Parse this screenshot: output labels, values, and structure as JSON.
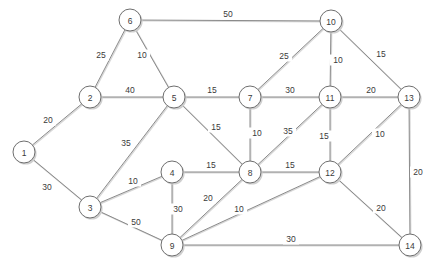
{
  "diagram": {
    "type": "node-link-weighted-graph",
    "colors": {
      "background": "#ffffff",
      "node_fill": "#ffffff",
      "node_stroke": "#6e6e6e",
      "edge_stroke": "#8a8a8a",
      "shadow": "#cfcfcf",
      "text": "#3a3a3a"
    },
    "node_radius": 11
  },
  "chart_data": {
    "type": "graph",
    "directed": false,
    "node_count": 14,
    "edge_count": 28,
    "nodes": [
      {
        "id": "1",
        "label": "1",
        "x": 24,
        "y": 152
      },
      {
        "id": "2",
        "label": "2",
        "x": 90,
        "y": 97
      },
      {
        "id": "3",
        "label": "3",
        "x": 90,
        "y": 207
      },
      {
        "id": "4",
        "label": "4",
        "x": 172,
        "y": 172
      },
      {
        "id": "5",
        "label": "5",
        "x": 174,
        "y": 97
      },
      {
        "id": "6",
        "label": "6",
        "x": 130,
        "y": 20
      },
      {
        "id": "7",
        "label": "7",
        "x": 250,
        "y": 97
      },
      {
        "id": "8",
        "label": "8",
        "x": 250,
        "y": 172
      },
      {
        "id": "9",
        "label": "9",
        "x": 172,
        "y": 245
      },
      {
        "id": "10",
        "label": "10",
        "x": 331,
        "y": 21
      },
      {
        "id": "11",
        "label": "11",
        "x": 330,
        "y": 97
      },
      {
        "id": "12",
        "label": "12",
        "x": 330,
        "y": 172
      },
      {
        "id": "13",
        "label": "13",
        "x": 409,
        "y": 97
      },
      {
        "id": "14",
        "label": "14",
        "x": 410,
        "y": 245
      }
    ],
    "edges": [
      {
        "source": "6",
        "target": "10",
        "weight": 50,
        "label": "50",
        "lx": 228,
        "ly": 14
      },
      {
        "source": "6",
        "target": "2",
        "weight": 25,
        "label": "25",
        "lx": 101,
        "ly": 55
      },
      {
        "source": "6",
        "target": "5",
        "weight": 10,
        "label": "10",
        "lx": 142,
        "ly": 55
      },
      {
        "source": "2",
        "target": "5",
        "weight": 40,
        "label": "40",
        "lx": 130,
        "ly": 90
      },
      {
        "source": "2",
        "target": "1",
        "weight": 20,
        "label": "20",
        "lx": 48,
        "ly": 120
      },
      {
        "source": "1",
        "target": "3",
        "weight": 30,
        "label": "30",
        "lx": 47,
        "ly": 187
      },
      {
        "source": "3",
        "target": "5",
        "weight": 35,
        "label": "35",
        "lx": 126,
        "ly": 143
      },
      {
        "source": "3",
        "target": "4",
        "weight": 10,
        "label": "10",
        "lx": 133,
        "ly": 181
      },
      {
        "source": "3",
        "target": "9",
        "weight": 50,
        "label": "50",
        "lx": 136,
        "ly": 222
      },
      {
        "source": "5",
        "target": "7",
        "weight": 15,
        "label": "15",
        "lx": 212,
        "ly": 90
      },
      {
        "source": "5",
        "target": "8",
        "weight": 15,
        "label": "15",
        "lx": 216,
        "ly": 127
      },
      {
        "source": "4",
        "target": "8",
        "weight": 15,
        "label": "15",
        "lx": 211,
        "ly": 165
      },
      {
        "source": "4",
        "target": "9",
        "weight": 30,
        "label": "30",
        "lx": 178,
        "ly": 209
      },
      {
        "source": "7",
        "target": "10",
        "weight": 25,
        "label": "25",
        "lx": 284,
        "ly": 56
      },
      {
        "source": "7",
        "target": "11",
        "weight": 30,
        "label": "30",
        "lx": 290,
        "ly": 90
      },
      {
        "source": "7",
        "target": "8",
        "weight": 10,
        "label": "10",
        "lx": 257,
        "ly": 133
      },
      {
        "source": "8",
        "target": "11",
        "weight": 35,
        "label": "35",
        "lx": 288,
        "ly": 131
      },
      {
        "source": "8",
        "target": "12",
        "weight": 15,
        "label": "15",
        "lx": 290,
        "ly": 165
      },
      {
        "source": "8",
        "target": "9",
        "weight": 20,
        "label": "20",
        "lx": 208,
        "ly": 198
      },
      {
        "source": "9",
        "target": "12",
        "weight": 10,
        "label": "10",
        "lx": 239,
        "ly": 209
      },
      {
        "source": "9",
        "target": "14",
        "weight": 30,
        "label": "30",
        "lx": 291,
        "ly": 239
      },
      {
        "source": "10",
        "target": "11",
        "weight": 10,
        "label": "10",
        "lx": 338,
        "ly": 60
      },
      {
        "source": "10",
        "target": "13",
        "weight": 15,
        "label": "15",
        "lx": 381,
        "ly": 54
      },
      {
        "source": "11",
        "target": "13",
        "weight": 20,
        "label": "20",
        "lx": 371,
        "ly": 90
      },
      {
        "source": "11",
        "target": "12",
        "weight": 15,
        "label": "15",
        "lx": 324,
        "ly": 136
      },
      {
        "source": "12",
        "target": "13",
        "weight": 10,
        "label": "10",
        "lx": 380,
        "ly": 134
      },
      {
        "source": "12",
        "target": "14",
        "weight": 20,
        "label": "20",
        "lx": 381,
        "ly": 208
      },
      {
        "source": "13",
        "target": "14",
        "weight": 20,
        "label": "20",
        "lx": 418,
        "ly": 172
      }
    ]
  }
}
